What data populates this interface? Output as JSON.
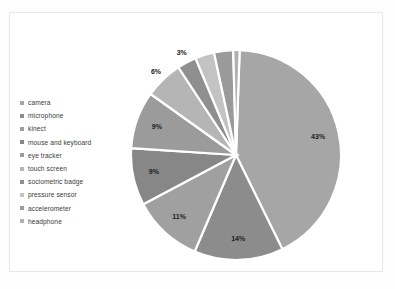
{
  "figure": {
    "background_color": "#ffffff",
    "border_color": "#e8e8e8"
  },
  "legend": {
    "position": "left",
    "items": [
      {
        "label": "camera",
        "color": "#a6a6a6"
      },
      {
        "label": "microphone",
        "color": "#8c8c8c"
      },
      {
        "label": "kinect",
        "color": "#a0a0a0"
      },
      {
        "label": "mouse and keyboard",
        "color": "#878787"
      },
      {
        "label": "eye tracker",
        "color": "#9b9b9b"
      },
      {
        "label": "touch screen",
        "color": "#b5b5b5"
      },
      {
        "label": "sociometric badge",
        "color": "#8f8f8f"
      },
      {
        "label": "pressure sensor",
        "color": "#c3c3c3"
      },
      {
        "label": "accelerometer",
        "color": "#9a9a9a"
      },
      {
        "label": "headphone",
        "color": "#b0b0b0"
      }
    ]
  },
  "chart_data": {
    "type": "pie",
    "title": "",
    "xlabel": "",
    "ylabel": "",
    "grid": false,
    "legend_position": "left",
    "start_angle_deg": -88,
    "direction": "clockwise",
    "categories": [
      "camera",
      "microphone",
      "kinect",
      "mouse and keyboard",
      "eye tracker",
      "touch screen",
      "sociometric badge",
      "pressure sensor",
      "accelerometer",
      "headphone"
    ],
    "values": [
      43,
      14,
      11,
      9,
      9,
      6,
      3,
      3,
      3,
      1
    ],
    "data_labels": [
      "43%",
      "14%",
      "11%",
      "9%",
      "9%",
      "6%",
      "3%",
      "3%",
      "3%",
      "1%"
    ],
    "colors": [
      "#a6a6a6",
      "#8c8c8c",
      "#a0a0a0",
      "#878787",
      "#9b9b9b",
      "#b5b5b5",
      "#8f8f8f",
      "#c3c3c3",
      "#9a9a9a",
      "#b0b0b0"
    ],
    "slice_gap_color": "#ffffff",
    "label_color": "#1c1c1c"
  }
}
